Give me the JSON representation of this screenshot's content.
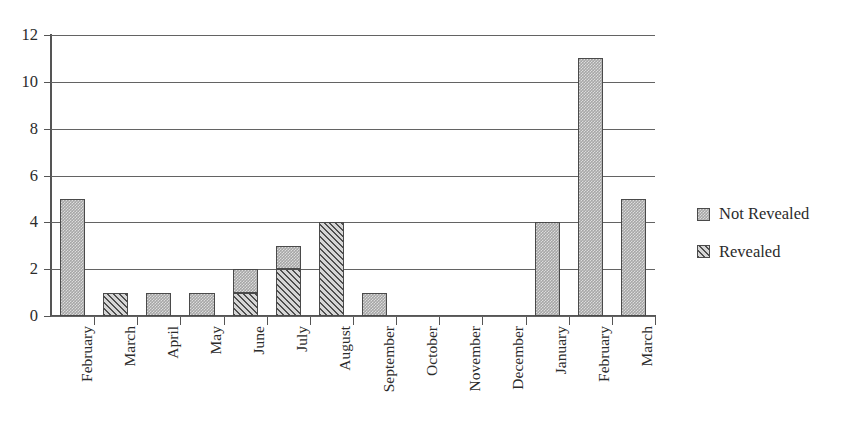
{
  "chart_data": {
    "type": "bar",
    "stacked": true,
    "title": "",
    "xlabel": "",
    "ylabel": "",
    "ylim": [
      0,
      12
    ],
    "yticks": [
      0,
      2,
      4,
      6,
      8,
      10,
      12
    ],
    "grid": true,
    "legend_position": "right",
    "categories": [
      "February",
      "March",
      "April",
      "May",
      "June",
      "July",
      "August",
      "September",
      "October",
      "November",
      "December",
      "January",
      "February",
      "March"
    ],
    "series": [
      {
        "name": "Not Revealed",
        "pattern": "solid-grey",
        "color": "#a6a6a6",
        "values": [
          5,
          0,
          1,
          1,
          1,
          1,
          0,
          1,
          0,
          0,
          0,
          4,
          11,
          5
        ]
      },
      {
        "name": "Revealed",
        "pattern": "diagonal-hatch",
        "color": "#c9c9c9",
        "values": [
          0,
          1,
          0,
          0,
          1,
          2,
          4,
          0,
          0,
          0,
          0,
          0,
          0,
          0
        ]
      }
    ],
    "totals": [
      5,
      1,
      1,
      1,
      2,
      3,
      4,
      1,
      0,
      0,
      0,
      4,
      11,
      5
    ]
  },
  "legend": {
    "items": [
      {
        "label": "Not Revealed"
      },
      {
        "label": "Revealed"
      }
    ]
  }
}
